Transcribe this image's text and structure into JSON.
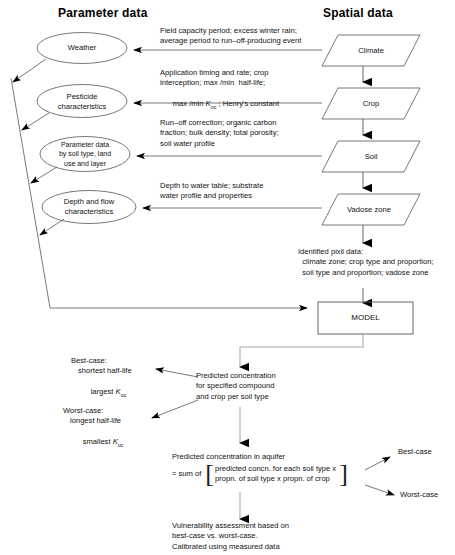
{
  "figure": {
    "type": "flowchart",
    "headers": {
      "left": "Parameter data",
      "right": "Spatial data"
    },
    "parameter_nodes": [
      {
        "id": "weather",
        "label": "Weather"
      },
      {
        "id": "pesticide",
        "label": "Pesticide\ncharacteristics"
      },
      {
        "id": "soilparam",
        "label": "Parameter data\nby soil type, land\nuse and layer"
      },
      {
        "id": "depthflow",
        "label": "Depth and flow\ncharacteristics"
      }
    ],
    "spatial_nodes": [
      {
        "id": "climate",
        "label": "Climate"
      },
      {
        "id": "crop",
        "label": "Crop"
      },
      {
        "id": "soil",
        "label": "Soil"
      },
      {
        "id": "vadose",
        "label": "Vadose zone"
      }
    ],
    "edge_annotations": [
      {
        "id": "climate-to-weather",
        "lines": [
          "Field capacity period; excess winter rain;",
          "average period to run–off-producing event"
        ]
      },
      {
        "id": "crop-to-pesticide",
        "lines": [
          "Application timing and rate; crop",
          "interception; max /min  half-life;",
          "max /min K_oc ; Henry's constant"
        ],
        "line3_pre": "max /min ",
        "line3_k": "K",
        "line3_sub": "oc",
        "line3_post": " ; Henry's constant"
      },
      {
        "id": "soil-to-soilparam",
        "lines": [
          "Run–off correction; organic carbon",
          "fraction; bulk density; total porosity;",
          "soil water profile"
        ]
      },
      {
        "id": "vadose-to-depthflow",
        "lines": [
          "Depth to water table; substrate",
          "water profile and properties"
        ]
      }
    ],
    "pixel_data": {
      "lines": [
        "Identified pixil data:",
        "  climate zone; crop type and proportion;",
        "  soil type and proportion; vadose zone"
      ]
    },
    "model_box": {
      "label": "MODEL"
    },
    "predicted_concentration": {
      "lines": [
        "Predicted concentration",
        "for specified compound",
        "and crop per soil type"
      ]
    },
    "best_case": {
      "title": "Best-case:",
      "line2": "shortest half-life",
      "line3_pre": "largest ",
      "line3_k": "K",
      "line3_sub": "oc"
    },
    "worst_case": {
      "title": "Worst-case:",
      "line2": "longest half-life",
      "line3_pre": "smallest ",
      "line3_k": "K",
      "line3_sub": "oc"
    },
    "aquifer": {
      "line1": "Predicted concentration in aquifer",
      "line2": "= sum of",
      "bracket_line1": "predicted concn. for each soil type x",
      "bracket_line2": "propn. of soil type x propn. of crop",
      "bracket_open": "[",
      "bracket_close": "]"
    },
    "outcome_labels": {
      "best": "Best-case",
      "worst": "Worst-case"
    },
    "conclusion": {
      "lines": [
        "Vulnerability assessment based on",
        "best-case vs. worst-case.",
        "Calibrated using measured data"
      ]
    },
    "colors": {
      "stroke": "#555555",
      "arrowhead": "#000000",
      "text": "#111111",
      "background": "#ffffff"
    }
  }
}
